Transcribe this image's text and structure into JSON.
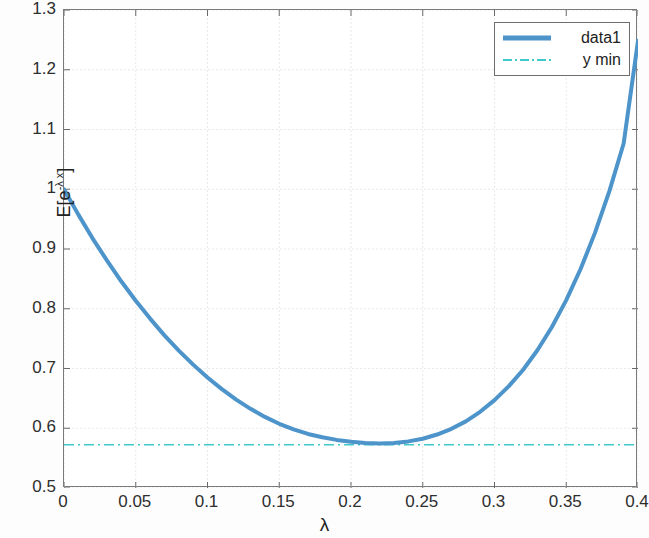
{
  "chart_data": {
    "type": "line",
    "title": "",
    "xlabel": "λ",
    "ylabel": "E[e^{-λ x}]",
    "ylabel_parts": {
      "prefix": "E[e",
      "exponent": "-λ x",
      "suffix": "]"
    },
    "xlim": [
      0,
      0.4
    ],
    "ylim": [
      0.5,
      1.3
    ],
    "grid": true,
    "legend_position": "top-right",
    "xticks": [
      0,
      0.05,
      0.1,
      0.15,
      0.2,
      0.25,
      0.3,
      0.35,
      0.4
    ],
    "xticklabels": [
      "0",
      "0.05",
      "0.1",
      "0.15",
      "0.2",
      "0.25",
      "0.3",
      "0.35",
      "0.4"
    ],
    "yticks": [
      0.5,
      0.6,
      0.7,
      0.8,
      0.9,
      1.0,
      1.1,
      1.2,
      1.3
    ],
    "yticklabels": [
      "0.5",
      "0.6",
      "0.7",
      "0.8",
      "0.9",
      "1",
      "1.1",
      "1.2",
      "1.3"
    ],
    "series": [
      {
        "name": "data1",
        "style": "solid",
        "color": "#4d94cb",
        "linewidth": 4,
        "x": [
          0,
          0.01,
          0.02,
          0.03,
          0.04,
          0.05,
          0.06,
          0.07,
          0.08,
          0.09,
          0.1,
          0.11,
          0.12,
          0.13,
          0.14,
          0.15,
          0.16,
          0.17,
          0.18,
          0.19,
          0.2,
          0.21,
          0.22,
          0.23,
          0.24,
          0.25,
          0.26,
          0.27,
          0.28,
          0.29,
          0.3,
          0.31,
          0.32,
          0.33,
          0.34,
          0.35,
          0.36,
          0.37,
          0.38,
          0.39,
          0.4
        ],
        "y": [
          1.0,
          0.9575,
          0.9175,
          0.8805,
          0.8455,
          0.8135,
          0.7835,
          0.7555,
          0.73,
          0.7065,
          0.685,
          0.6655,
          0.648,
          0.6325,
          0.619,
          0.6075,
          0.598,
          0.5905,
          0.585,
          0.5805,
          0.5775,
          0.5755,
          0.5745,
          0.5755,
          0.578,
          0.5825,
          0.5895,
          0.599,
          0.6115,
          0.6275,
          0.647,
          0.6705,
          0.698,
          0.731,
          0.7695,
          0.8145,
          0.8665,
          0.927,
          0.9965,
          1.0765,
          1.2485
        ]
      },
      {
        "name": "y min",
        "style": "dash-dot",
        "color": "#3fc9c9",
        "linewidth": 1.5,
        "constant_y": 0.5725
      }
    ],
    "annotations": {
      "minimum_x": 0.16,
      "minimum_y": 0.5725,
      "start_value": 1.0,
      "end_value": 1.2485
    }
  },
  "legend": {
    "entries": [
      {
        "label": "data1"
      },
      {
        "label": "y min"
      }
    ]
  }
}
